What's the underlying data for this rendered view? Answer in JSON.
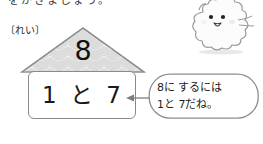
{
  "page": {
    "background_color": "#ffffff",
    "cut_off_header_text": "をかきましょう。"
  },
  "example_label": {
    "text": "〔れい〕"
  },
  "house": {
    "roof": {
      "number": "8",
      "fill_color": "#d9d9d9",
      "outline_color": "#8d8d8d",
      "pattern": "scallop-waves"
    },
    "body": {
      "expression": "1 と 7",
      "border_color": "#8a8a8a",
      "fill_color": "#ffffff"
    }
  },
  "arrow": {
    "direction": "left",
    "color": "#7d7d7d"
  },
  "speech_bubble": {
    "line1": "8に するには",
    "line2": "1と 7だね。",
    "outline_color": "#8d8d8d",
    "fill_color": "#ffffff"
  },
  "mascot": {
    "name": "fluffy-cloud-character",
    "body_color": "#fbfbfb",
    "outline_color": "#9a9a9a",
    "blush_color": "#ededed"
  }
}
